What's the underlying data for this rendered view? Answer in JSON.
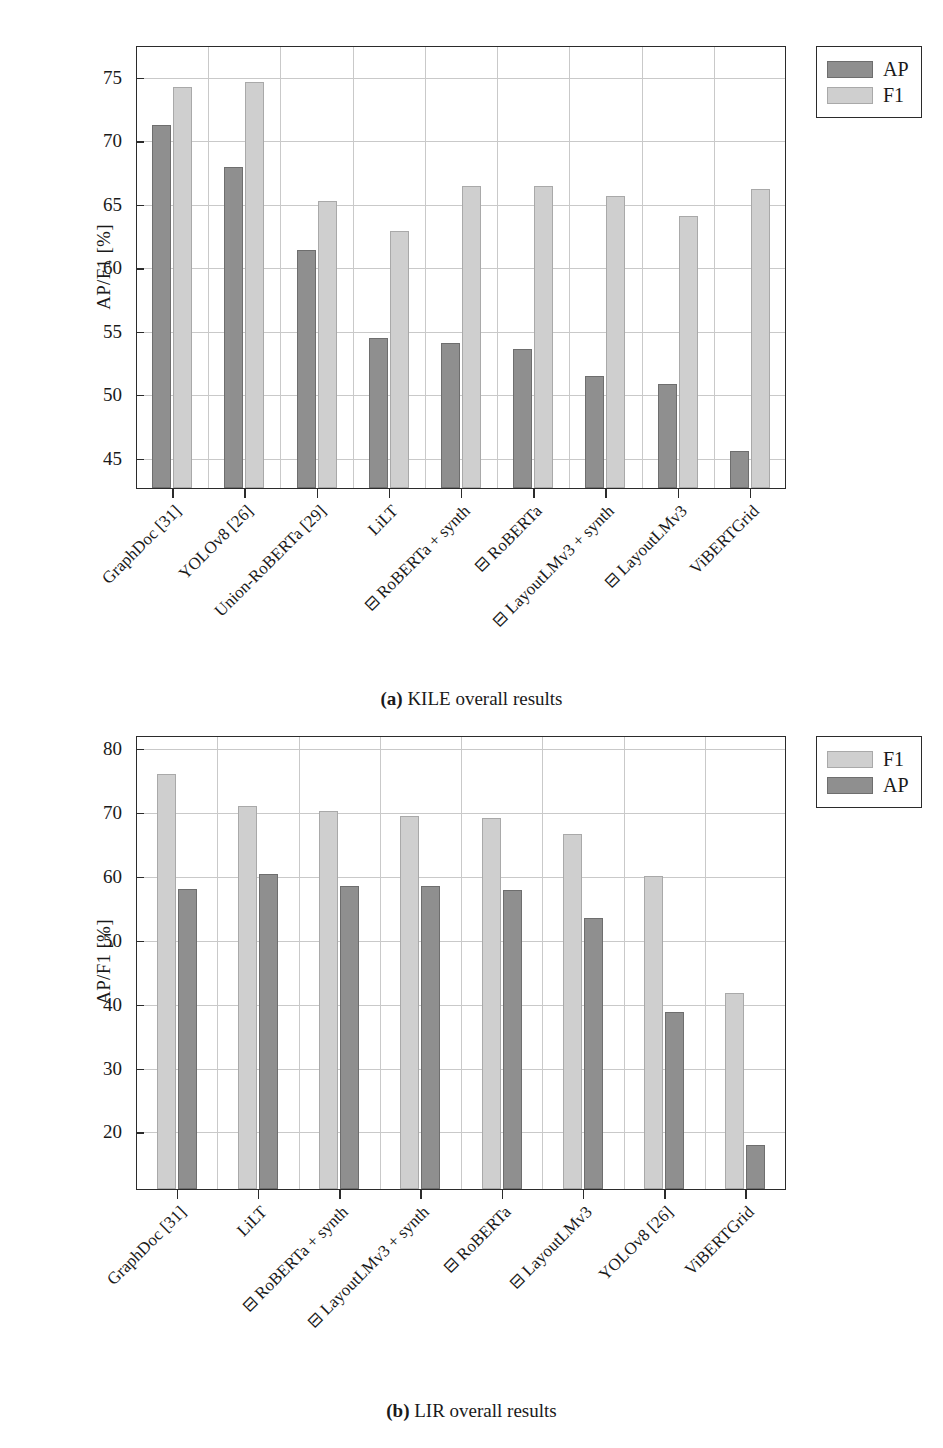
{
  "figure": {
    "panels": [
      {
        "id": "a",
        "caption_tag": "(a)",
        "caption_text": "KILE overall results",
        "ylabel": "AP/F1 [%]",
        "ytick_labels": [
          "75",
          "70",
          "65",
          "60",
          "55",
          "50",
          "45"
        ],
        "legend": [
          {
            "key": "ap",
            "label": "AP"
          },
          {
            "key": "f1",
            "label": "F1"
          }
        ],
        "categories": [
          "GraphDoc [31]",
          "YOLOv8 [26]",
          "Union-RoBERTa [29]",
          "LiLT",
          "⊟ RoBERTa + synth",
          "⊟ RoBERTa",
          "⊟ LayoutLMv3 + synth",
          "⊟ LayoutLMv3",
          "ViBERTGrid"
        ]
      },
      {
        "id": "b",
        "caption_tag": "(b)",
        "caption_text": "LIR overall results",
        "ylabel": "AP/F1 [%]",
        "ytick_labels": [
          "80",
          "70",
          "60",
          "50",
          "40",
          "30",
          "20"
        ],
        "legend": [
          {
            "key": "f1",
            "label": "F1"
          },
          {
            "key": "ap",
            "label": "AP"
          }
        ],
        "categories": [
          "GraphDoc [31]",
          "LiLT",
          "⊟ RoBERTa + synth",
          "⊟ LayoutLMv3 + synth",
          "⊟ RoBERTa",
          "⊟ LayoutLMv3",
          "YOLOv8 [26]",
          "ViBERTGrid"
        ]
      }
    ]
  },
  "chart_data": [
    {
      "type": "bar",
      "title": "(a) KILE overall results",
      "xlabel": "",
      "ylabel": "AP/F1 [%]",
      "ylim": [
        42.6,
        77.5
      ],
      "yticks": [
        45,
        50,
        55,
        60,
        65,
        70,
        75
      ],
      "grid": true,
      "legend_position": "top-right-outside",
      "categories": [
        "GraphDoc [31]",
        "YOLOv8 [26]",
        "Union-RoBERTa [29]",
        "LiLT",
        "⊟ RoBERTa + synth",
        "⊟ RoBERTa",
        "⊟ LayoutLMv3 + synth",
        "⊟ LayoutLMv3",
        "ViBERTGrid"
      ],
      "series": [
        {
          "name": "AP",
          "color": "#8f8f8f",
          "values": [
            71.3,
            68.0,
            61.4,
            54.5,
            54.1,
            53.6,
            51.5,
            50.9,
            45.6
          ]
        },
        {
          "name": "F1",
          "color": "#cfcfcf",
          "values": [
            74.3,
            74.7,
            65.3,
            62.9,
            66.5,
            66.5,
            65.7,
            64.1,
            66.2
          ]
        }
      ]
    },
    {
      "type": "bar",
      "title": "(b) LIR overall results",
      "xlabel": "",
      "ylabel": "AP/F1 [%]",
      "ylim": [
        11.0,
        82.0
      ],
      "yticks": [
        20,
        30,
        40,
        50,
        60,
        70,
        80
      ],
      "grid": true,
      "legend_position": "top-right-outside",
      "categories": [
        "GraphDoc [31]",
        "LiLT",
        "⊟ RoBERTa + synth",
        "⊟ LayoutLMv3 + synth",
        "⊟ RoBERTa",
        "⊟ LayoutLMv3",
        "YOLOv8 [26]",
        "ViBERTGrid"
      ],
      "series": [
        {
          "name": "F1",
          "color": "#cfcfcf",
          "values": [
            76.0,
            71.0,
            70.3,
            69.5,
            69.1,
            66.6,
            60.1,
            41.8
          ]
        },
        {
          "name": "AP",
          "color": "#8f8f8f",
          "values": [
            58.0,
            60.4,
            58.5,
            58.5,
            57.9,
            53.6,
            38.9,
            18.0
          ]
        }
      ]
    }
  ]
}
